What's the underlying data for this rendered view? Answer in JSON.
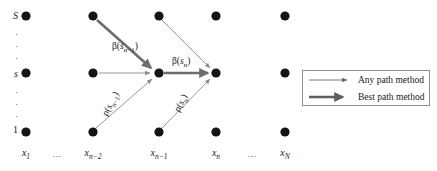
{
  "figure": {
    "type": "trellis-diagram",
    "background": "#ffffff",
    "colors": {
      "node": "#151515",
      "any_path_arrow": "#8c8c8c",
      "best_path_arrow": "#6d6d6d",
      "legend_border": "#8d8d8d",
      "text": "#1a1a1a"
    }
  },
  "y_axis": {
    "top_label": "S",
    "middle_label": "s",
    "bottom_label": "1",
    "dots": [
      "·",
      "·",
      "·"
    ],
    "dots_lower": [
      "·",
      "·",
      "·"
    ]
  },
  "x_axis": {
    "labels": [
      {
        "text": "x",
        "sub": "1",
        "x": 26
      },
      {
        "text": "…",
        "sub": "",
        "x": 57,
        "ellipsis": true
      },
      {
        "text": "x",
        "sub": "n−2",
        "x": 93
      },
      {
        "text": "x",
        "sub": "n−1",
        "x": 159
      },
      {
        "text": "x",
        "sub": "n",
        "x": 216
      },
      {
        "text": "…",
        "sub": "",
        "x": 252,
        "ellipsis": true
      },
      {
        "text": "x",
        "sub": "N",
        "x": 285
      }
    ]
  },
  "nodes": {
    "columns_x": [
      26,
      93,
      159,
      216,
      252,
      285
    ],
    "rows_y": [
      16,
      73,
      132
    ],
    "radius": 4.6
  },
  "edge_labels": [
    {
      "id": "beta-n-1",
      "greek": "β",
      "var": "s",
      "sub": "n−1",
      "x": 112,
      "y": 42,
      "rotated": false
    },
    {
      "id": "beta-n",
      "greek": "β",
      "var": "s",
      "sub": "n",
      "x": 172,
      "y": 57,
      "rotated": false
    },
    {
      "id": "rho-n-1",
      "greek": "ρ",
      "var": "s",
      "sub": "n−1",
      "x": 108,
      "y": 108,
      "rotated": true
    },
    {
      "id": "rho-n",
      "greek": "ρ",
      "var": "s",
      "sub": "n",
      "x": 178,
      "y": 106,
      "rotated": true
    }
  ],
  "legend": {
    "items": [
      {
        "label": "Any path method",
        "style": "any_path",
        "stroke_width": 0.9
      },
      {
        "label": "Best path method",
        "style": "best_path",
        "stroke_width": 2.6
      }
    ]
  }
}
